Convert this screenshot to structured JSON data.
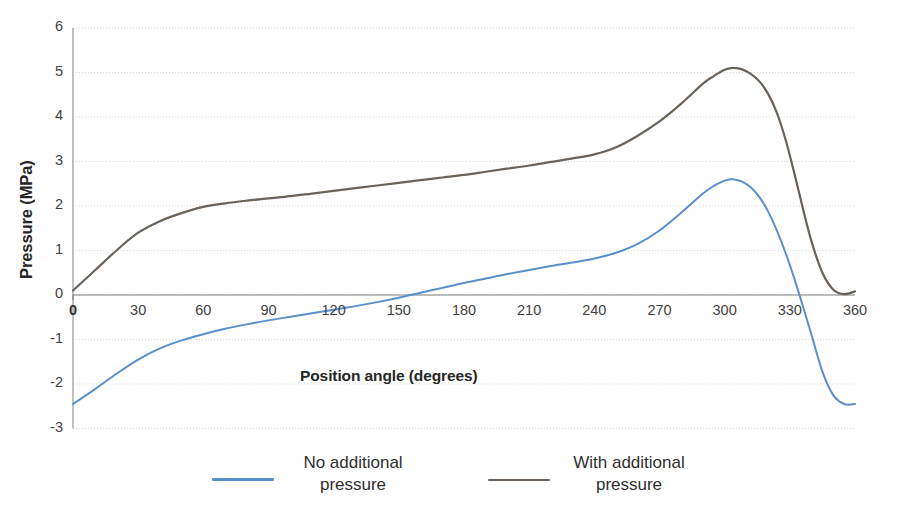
{
  "chart_data": {
    "type": "line",
    "title": "",
    "xlabel": "Position angle (degrees)",
    "ylabel": "Pressure (MPa)",
    "xlim": [
      0,
      360
    ],
    "ylim": [
      -3,
      6
    ],
    "xticks": [
      0,
      30,
      60,
      90,
      120,
      150,
      180,
      210,
      240,
      270,
      300,
      330,
      360
    ],
    "yticks": [
      6,
      5,
      4,
      3,
      2,
      1,
      0,
      -1,
      -2,
      -3
    ],
    "grid": true,
    "legend_position": "bottom",
    "x": [
      0,
      10,
      20,
      30,
      40,
      50,
      60,
      70,
      80,
      90,
      100,
      110,
      120,
      130,
      140,
      150,
      160,
      170,
      180,
      190,
      200,
      210,
      220,
      230,
      240,
      250,
      260,
      270,
      280,
      290,
      295,
      300,
      303,
      305,
      308,
      312,
      316,
      320,
      324,
      328,
      332,
      336,
      340,
      345,
      350,
      355,
      360
    ],
    "series": [
      {
        "name": "No additional pressure",
        "color": "#5B8FCB",
        "values": [
          -2.45,
          -2.12,
          -1.77,
          -1.45,
          -1.2,
          -1.02,
          -0.88,
          -0.76,
          -0.66,
          -0.57,
          -0.49,
          -0.41,
          -0.33,
          -0.25,
          -0.16,
          -0.06,
          0.05,
          0.16,
          0.27,
          0.37,
          0.47,
          0.56,
          0.65,
          0.73,
          0.82,
          0.95,
          1.15,
          1.45,
          1.85,
          2.28,
          2.45,
          2.57,
          2.6,
          2.59,
          2.55,
          2.42,
          2.2,
          1.88,
          1.45,
          0.95,
          0.38,
          -0.25,
          -0.9,
          -1.72,
          -2.25,
          -2.45,
          -2.45
        ]
      },
      {
        "name": "With additional pressure",
        "color": "#6B6259",
        "values": [
          0.1,
          0.55,
          1.0,
          1.4,
          1.66,
          1.84,
          1.98,
          2.06,
          2.12,
          2.17,
          2.22,
          2.28,
          2.34,
          2.4,
          2.46,
          2.52,
          2.58,
          2.64,
          2.7,
          2.77,
          2.84,
          2.91,
          2.99,
          3.07,
          3.16,
          3.32,
          3.58,
          3.9,
          4.3,
          4.75,
          4.92,
          5.06,
          5.1,
          5.1,
          5.07,
          4.97,
          4.8,
          4.52,
          4.1,
          3.5,
          2.75,
          1.95,
          1.2,
          0.5,
          0.12,
          0.02,
          0.08
        ]
      }
    ]
  },
  "axis": {
    "y_title": "Pressure (MPa)",
    "x_title": "Position angle (degrees)",
    "y_tick_labels": [
      "6",
      "5",
      "4",
      "3",
      "2",
      "1",
      "0",
      "-1",
      "-2",
      "-3"
    ],
    "x_tick_labels": [
      "0",
      "30",
      "60",
      "90",
      "120",
      "150",
      "180",
      "210",
      "240",
      "270",
      "300",
      "330",
      "360"
    ],
    "origin_label": "0"
  },
  "legend": {
    "entries": [
      {
        "line1": "No additional",
        "line2": "pressure",
        "color": "#5B8FCB"
      },
      {
        "line1": "With additional",
        "line2": "pressure",
        "color": "#6B6259"
      }
    ]
  },
  "colors": {
    "series_blue": "#5B8FCB",
    "series_gray": "#6B6259",
    "gridline": "#D9D9D9",
    "axis": "#8C8C8C",
    "text": "#3F3F3F"
  }
}
